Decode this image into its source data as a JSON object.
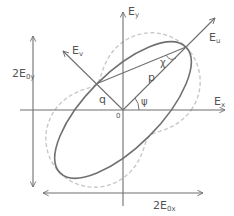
{
  "diagram": {
    "colors": {
      "axis": "#6f6f6f",
      "ellipse": "#707070",
      "dashed": "#c8c8c8",
      "text": "#555555"
    },
    "geometry": {
      "origin": [
        123,
        110
      ],
      "semi_major": 89,
      "semi_minor": 37,
      "psi_deg": 45
    },
    "labels": {
      "ey_main": "E",
      "ey_sub": "y",
      "ex_main": "E",
      "ex_sub": "x",
      "eu_main": "E",
      "eu_sub": "u",
      "ev_main": "E",
      "ev_sub": "v",
      "p": "p",
      "q": "q",
      "chi": "χ",
      "psi": "ψ",
      "origin": "0",
      "height_main": "2E",
      "height_sub": "0y",
      "width_main": "2E",
      "width_sub": "0x"
    }
  }
}
